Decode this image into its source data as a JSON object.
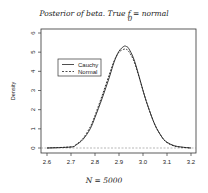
{
  "chart_data": {
    "type": "line",
    "title_main": "Posterior of beta. True ",
    "title_f": "f",
    "title_sub": "0",
    "title_rest": " = normal",
    "xlabel": "N = 5000",
    "ylabel": "Density",
    "xlim": [
      2.6,
      3.2
    ],
    "ylim": [
      0,
      6
    ],
    "xticks": [
      "2.6",
      "2.7",
      "2.8",
      "2.9",
      "3.0",
      "3.1",
      "3.2"
    ],
    "yticks": [
      "0",
      "1",
      "2",
      "3",
      "4",
      "5",
      "6"
    ],
    "grid": false,
    "legend_position": "upper-left",
    "series": [
      {
        "name": "Cauchy",
        "style": "solid",
        "x": [
          2.6,
          2.7,
          2.72,
          2.75,
          2.78,
          2.8,
          2.83,
          2.86,
          2.88,
          2.9,
          2.92,
          2.93,
          2.94,
          2.96,
          2.98,
          3.0,
          3.02,
          3.05,
          3.08,
          3.1,
          3.13,
          3.16,
          3.2
        ],
        "values": [
          0.0,
          0.05,
          0.15,
          0.45,
          1.0,
          1.6,
          2.6,
          3.7,
          4.5,
          5.05,
          5.3,
          5.3,
          5.2,
          4.7,
          3.9,
          3.0,
          2.2,
          1.2,
          0.55,
          0.3,
          0.12,
          0.05,
          0.0
        ]
      },
      {
        "name": "Normal",
        "style": "dashed",
        "x": [
          2.6,
          2.7,
          2.72,
          2.75,
          2.78,
          2.8,
          2.83,
          2.86,
          2.88,
          2.9,
          2.92,
          2.93,
          2.94,
          2.96,
          2.98,
          3.0,
          3.02,
          3.05,
          3.08,
          3.1,
          3.13,
          3.16,
          3.2
        ],
        "values": [
          0.0,
          0.06,
          0.17,
          0.5,
          1.1,
          1.7,
          2.75,
          3.85,
          4.55,
          5.0,
          5.15,
          5.15,
          5.05,
          4.6,
          3.85,
          3.0,
          2.2,
          1.2,
          0.55,
          0.28,
          0.1,
          0.04,
          0.0
        ]
      }
    ]
  },
  "legend": {
    "items": [
      {
        "label": "Cauchy",
        "style": "solid"
      },
      {
        "label": "Normal",
        "style": "dashed"
      }
    ]
  },
  "colors": {
    "line": "#222222",
    "axis": "#333333",
    "background": "#ffffff"
  }
}
